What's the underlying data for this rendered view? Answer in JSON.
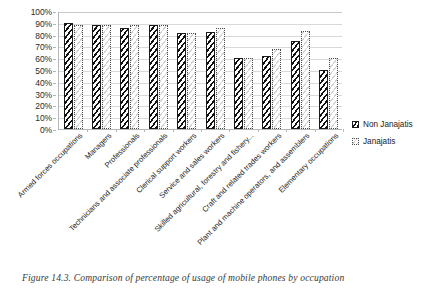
{
  "caption": "Figure 14.3. Comparison of percentage of usage of mobile phones by occupation",
  "legend": {
    "position": "right",
    "items": [
      {
        "label": "Non Janajatis",
        "marker": "dark-diagonal-hatch-swatch"
      },
      {
        "label": "Janajatis",
        "marker": "light-dotted-hatch-swatch"
      }
    ]
  },
  "axis": {
    "y_ticks": [
      "0%",
      "10%",
      "20%",
      "30%",
      "40%",
      "50%",
      "60%",
      "70%",
      "80%",
      "90%",
      "100%"
    ]
  },
  "chart_data": {
    "type": "bar",
    "title": "",
    "xlabel": "",
    "ylabel": "",
    "ylim": [
      0,
      100
    ],
    "ytick_step": 10,
    "grid": true,
    "legend_position": "right",
    "categories": [
      "Armed forces occupations",
      "Managers",
      "Professionals",
      "Technicians and associate professionals",
      "Clerical support workers",
      "Service and sales workers",
      "Skilled agricultural, forestry and fishery...",
      "Craft and related trades workers",
      "Plant and machine operators, and assemblers",
      "Elementary occupations"
    ],
    "series": [
      {
        "name": "Non Janajatis",
        "values": [
          90,
          88,
          86,
          88,
          81,
          82,
          60,
          62,
          75,
          50
        ]
      },
      {
        "name": "Janajatis",
        "values": [
          88,
          88,
          88,
          88,
          81,
          86,
          60,
          68,
          83,
          60
        ]
      }
    ]
  }
}
